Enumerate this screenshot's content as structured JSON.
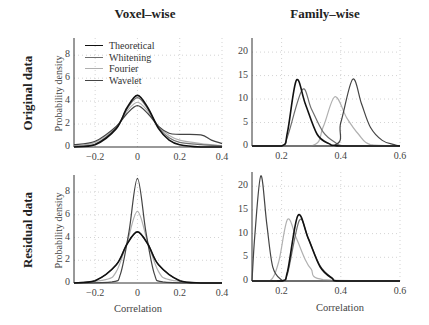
{
  "figure": {
    "column_titles": [
      "Voxel–wise",
      "Family–wise"
    ],
    "row_titles": [
      "Original data",
      "Residual data"
    ],
    "ylabel": "Probability density",
    "xlabel": "Correlation"
  },
  "legend": {
    "items": [
      {
        "label": "Theoretical",
        "color": "#111111"
      },
      {
        "label": "Whitening",
        "color": "#6e6e6e"
      },
      {
        "label": "Fourier",
        "color": "#b0b0b0"
      },
      {
        "label": "Wavelet",
        "color": "#444444"
      }
    ]
  },
  "chart_data": [
    {
      "type": "line",
      "title": "Voxel–wise / Original data",
      "xlabel": "",
      "ylabel": "Probability density",
      "xlim": [
        -0.3,
        0.4
      ],
      "ylim": [
        0,
        9.5
      ],
      "xticks": [
        -0.2,
        0,
        0.2,
        0.4
      ],
      "yticks": [
        0,
        2,
        4,
        6,
        8
      ],
      "grid": true,
      "legend_position": "upper left",
      "series": [
        {
          "name": "Theoretical",
          "x": [
            -0.3,
            -0.2,
            -0.1,
            -0.05,
            0,
            0.05,
            0.1,
            0.15,
            0.2,
            0.3,
            0.4
          ],
          "values": [
            0.0,
            0.2,
            1.6,
            3.4,
            4.5,
            3.4,
            1.6,
            0.6,
            0.2,
            0.0,
            0.0
          ]
        },
        {
          "name": "Whitening",
          "x": [
            -0.3,
            -0.2,
            -0.1,
            -0.05,
            0,
            0.05,
            0.1,
            0.15,
            0.2,
            0.3,
            0.4
          ],
          "values": [
            0.05,
            0.25,
            1.7,
            3.3,
            4.3,
            3.3,
            1.7,
            0.8,
            0.4,
            0.2,
            0.1
          ]
        },
        {
          "name": "Fourier",
          "x": [
            -0.3,
            -0.2,
            -0.1,
            -0.05,
            0,
            0.05,
            0.1,
            0.15,
            0.2,
            0.3,
            0.4
          ],
          "values": [
            0.1,
            0.4,
            1.8,
            3.1,
            3.9,
            3.1,
            1.8,
            1.0,
            0.6,
            0.3,
            0.1
          ]
        },
        {
          "name": "Wavelet",
          "x": [
            -0.3,
            -0.2,
            -0.1,
            -0.05,
            0,
            0.05,
            0.1,
            0.15,
            0.2,
            0.3,
            0.35,
            0.4
          ],
          "values": [
            0.2,
            0.5,
            1.8,
            2.9,
            3.6,
            2.9,
            1.8,
            1.2,
            1.1,
            1.05,
            0.6,
            0.3
          ]
        }
      ]
    },
    {
      "type": "line",
      "title": "Family–wise / Original data",
      "xlabel": "",
      "ylabel": "",
      "xlim": [
        0.1,
        0.6
      ],
      "ylim": [
        0,
        23
      ],
      "xticks": [
        0.2,
        0.4,
        0.6
      ],
      "yticks": [
        0,
        5,
        10,
        15,
        20
      ],
      "grid": true,
      "series": [
        {
          "name": "Theoretical",
          "x": [
            0.1,
            0.2,
            0.22,
            0.25,
            0.28,
            0.32,
            0.36,
            0.4,
            0.6
          ],
          "values": [
            0,
            0,
            3,
            14,
            9,
            2.5,
            0.5,
            0,
            0
          ]
        },
        {
          "name": "Whitening",
          "x": [
            0.1,
            0.2,
            0.22,
            0.27,
            0.3,
            0.34,
            0.38,
            0.42,
            0.6
          ],
          "values": [
            0,
            0,
            2,
            12,
            8,
            3,
            0.8,
            0,
            0
          ]
        },
        {
          "name": "Fourier",
          "x": [
            0.1,
            0.3,
            0.34,
            0.38,
            0.42,
            0.46,
            0.5,
            0.6
          ],
          "values": [
            0,
            0,
            4,
            10.5,
            6,
            2.5,
            0.3,
            0
          ]
        },
        {
          "name": "Wavelet",
          "x": [
            0.1,
            0.37,
            0.4,
            0.44,
            0.47,
            0.5,
            0.54,
            0.58,
            0.6
          ],
          "values": [
            0,
            0,
            5,
            14.2,
            9,
            4,
            1.2,
            0.3,
            0
          ]
        }
      ]
    },
    {
      "type": "line",
      "title": "Voxel–wise / Residual data",
      "xlabel": "Correlation",
      "ylabel": "Probability density",
      "xlim": [
        -0.3,
        0.4
      ],
      "ylim": [
        0,
        9.5
      ],
      "xticks": [
        -0.2,
        0,
        0.2,
        0.4
      ],
      "yticks": [
        0,
        2,
        4,
        6,
        8
      ],
      "grid": true,
      "series": [
        {
          "name": "Theoretical",
          "x": [
            -0.3,
            -0.2,
            -0.1,
            -0.05,
            0,
            0.05,
            0.1,
            0.2,
            0.3,
            0.4
          ],
          "values": [
            0,
            0.2,
            1.6,
            3.4,
            4.5,
            3.4,
            1.6,
            0.2,
            0,
            0
          ]
        },
        {
          "name": "Whitening",
          "x": [
            -0.3,
            -0.2,
            -0.1,
            -0.05,
            0,
            0.05,
            0.1,
            0.2,
            0.3,
            0.4
          ],
          "values": [
            0,
            0.2,
            1.6,
            3.4,
            4.5,
            3.4,
            1.6,
            0.2,
            0,
            0
          ]
        },
        {
          "name": "Fourier",
          "x": [
            -0.3,
            -0.15,
            -0.1,
            -0.05,
            0,
            0.05,
            0.1,
            0.15,
            0.3,
            0.4
          ],
          "values": [
            0,
            0.3,
            1.0,
            3.5,
            6.3,
            3.5,
            1.0,
            0.3,
            0,
            0
          ]
        },
        {
          "name": "Wavelet",
          "x": [
            -0.3,
            -0.12,
            -0.08,
            -0.04,
            0,
            0.04,
            0.08,
            0.12,
            0.3,
            0.4
          ],
          "values": [
            0,
            0.1,
            0.8,
            4.5,
            9.2,
            4.5,
            0.8,
            0.1,
            0,
            0
          ]
        }
      ]
    },
    {
      "type": "line",
      "title": "Family–wise / Residual data",
      "xlabel": "Correlation",
      "ylabel": "",
      "xlim": [
        0.1,
        0.6
      ],
      "ylim": [
        0,
        23
      ],
      "xticks": [
        0.2,
        0.4,
        0.6
      ],
      "yticks": [
        0,
        5,
        10,
        15,
        20
      ],
      "grid": true,
      "series": [
        {
          "name": "Theoretical",
          "x": [
            0.1,
            0.2,
            0.22,
            0.255,
            0.29,
            0.33,
            0.37,
            0.4,
            0.6
          ],
          "values": [
            0,
            0,
            2,
            13.8,
            9,
            3,
            0.6,
            0,
            0
          ]
        },
        {
          "name": "Whitening",
          "x": [
            0.1,
            0.2,
            0.22,
            0.26,
            0.29,
            0.33,
            0.37,
            0.4,
            0.6
          ],
          "values": [
            0,
            0,
            1.5,
            12.8,
            9,
            3.2,
            0.7,
            0,
            0
          ]
        },
        {
          "name": "Fourier",
          "x": [
            0.1,
            0.16,
            0.19,
            0.22,
            0.25,
            0.28,
            0.3,
            0.34,
            0.6
          ],
          "values": [
            0,
            0,
            4,
            13,
            9,
            4.5,
            2.5,
            0.3,
            0
          ]
        },
        {
          "name": "Wavelet",
          "x": [
            0.1,
            0.11,
            0.13,
            0.15,
            0.17,
            0.2,
            0.22,
            0.6
          ],
          "values": [
            0,
            10,
            22.2,
            12,
            3,
            0.2,
            0,
            0
          ]
        }
      ]
    }
  ]
}
